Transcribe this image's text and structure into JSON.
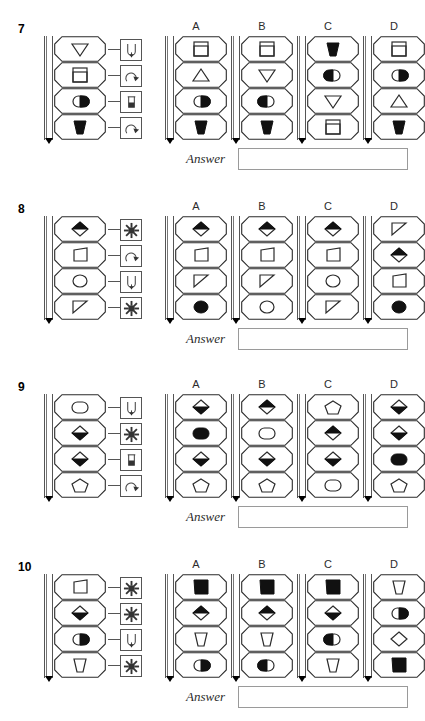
{
  "worksheet": {
    "answer_label": "Answer",
    "option_labels": [
      "A",
      "B",
      "C",
      "D"
    ]
  },
  "icon_names": {
    "U": "u-magnet-icon",
    "S": "sun-burst-icon",
    "R": "rotate-arrow-icon",
    "T": "flask-tube-icon"
  },
  "shape_legend": {
    "tri_down": "triangle-down",
    "tri_up": "triangle-up",
    "sq_in_sq": "square-in-square",
    "oval_half": "oval-half-filled-right",
    "oval_half_left": "oval-half-filled-left",
    "trap_filled": "trapezoid-filled",
    "trap": "trapezoid",
    "diamond_half": "diamond-half-filled",
    "diamond_top": "diamond-top-filled",
    "diamond": "diamond",
    "pent": "pentagon",
    "oval": "oval",
    "oval_filled": "oval-filled",
    "circle": "circle",
    "circle_filled": "circle-filled",
    "rtri": "right-triangle",
    "rect": "rectangle",
    "rect_filled": "rectangle-filled",
    "quad": "quadrilateral",
    "cup": "cup-trapezoid",
    "blob_filled": "blob-filled"
  },
  "questions": [
    {
      "number": "7",
      "stem": {
        "shapes": [
          "tri_down",
          "sq_in_sq",
          "oval_half",
          "trap_filled"
        ],
        "operators": [
          "U",
          "R",
          "T",
          "R"
        ]
      },
      "options": [
        {
          "label": "A",
          "shapes": [
            "sq_in_sq",
            "tri_up",
            "oval_half",
            "trap_filled"
          ]
        },
        {
          "label": "B",
          "shapes": [
            "sq_in_sq",
            "tri_down",
            "oval_half_left",
            "trap_filled"
          ]
        },
        {
          "label": "C",
          "shapes": [
            "trap_filled",
            "oval_half_left",
            "tri_down",
            "sq_in_sq"
          ]
        },
        {
          "label": "D",
          "shapes": [
            "sq_in_sq",
            "oval_half",
            "tri_up",
            "trap_filled"
          ]
        }
      ]
    },
    {
      "number": "8",
      "stem": {
        "shapes": [
          "diamond_top",
          "quad",
          "circle",
          "rtri"
        ],
        "operators": [
          "S",
          "R",
          "U",
          "S"
        ]
      },
      "options": [
        {
          "label": "A",
          "shapes": [
            "diamond_top",
            "quad",
            "rtri",
            "circle_filled"
          ]
        },
        {
          "label": "B",
          "shapes": [
            "diamond_top",
            "quad",
            "rtri",
            "circle"
          ]
        },
        {
          "label": "C",
          "shapes": [
            "diamond_top",
            "quad",
            "circle",
            "rtri"
          ]
        },
        {
          "label": "D",
          "shapes": [
            "rtri",
            "diamond_top",
            "quad",
            "circle_filled"
          ]
        }
      ]
    },
    {
      "number": "9",
      "stem": {
        "shapes": [
          "oval",
          "diamond_half",
          "diamond_half",
          "pent"
        ],
        "operators": [
          "U",
          "S",
          "T",
          "R"
        ]
      },
      "options": [
        {
          "label": "A",
          "shapes": [
            "diamond_half",
            "oval_filled",
            "diamond_half",
            "pent"
          ]
        },
        {
          "label": "B",
          "shapes": [
            "diamond_top",
            "oval",
            "diamond_half",
            "pent"
          ]
        },
        {
          "label": "C",
          "shapes": [
            "pent",
            "diamond_top",
            "diamond_half",
            "oval"
          ]
        },
        {
          "label": "D",
          "shapes": [
            "diamond_half",
            "diamond_half",
            "oval_filled",
            "pent"
          ]
        }
      ]
    },
    {
      "number": "10",
      "stem": {
        "shapes": [
          "quad",
          "diamond_half",
          "oval_half",
          "cup"
        ],
        "operators": [
          "S",
          "S",
          "U",
          "S"
        ]
      },
      "options": [
        {
          "label": "A",
          "shapes": [
            "rect_filled",
            "diamond_top",
            "cup",
            "oval_half"
          ]
        },
        {
          "label": "B",
          "shapes": [
            "rect_filled",
            "diamond_top",
            "cup",
            "oval_half_left"
          ]
        },
        {
          "label": "C",
          "shapes": [
            "rect_filled",
            "diamond_half",
            "oval_half_left",
            "cup"
          ]
        },
        {
          "label": "D",
          "shapes": [
            "cup",
            "oval_half",
            "diamond",
            "rect_filled"
          ]
        }
      ]
    }
  ]
}
